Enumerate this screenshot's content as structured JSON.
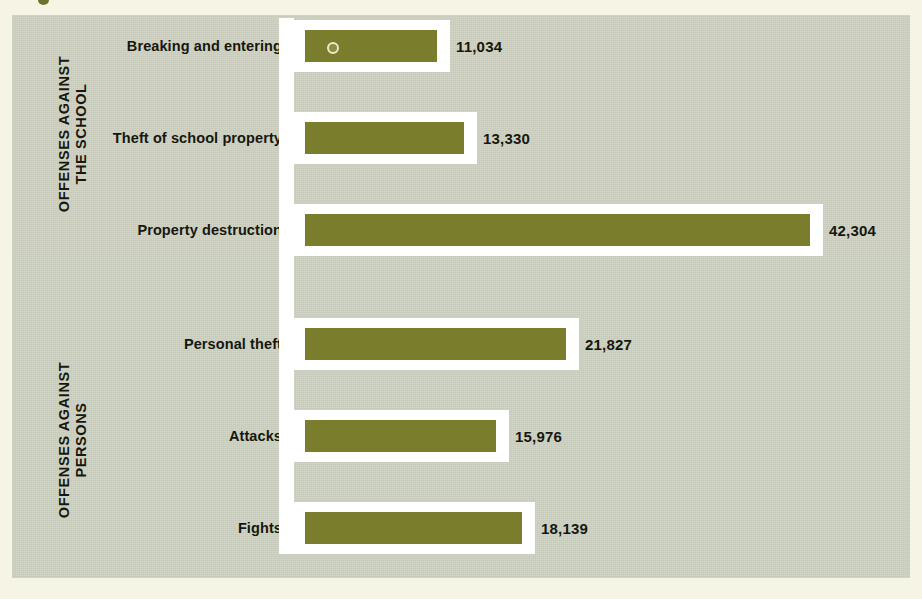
{
  "colors": {
    "page_background": "#f6f4e4",
    "panel_background": "#ccd0bf",
    "bar_fill": "#7a7d2c",
    "bar_outline": "#ffffff",
    "text": "#16170e"
  },
  "groups": [
    {
      "id": "school",
      "label": "OFFENSES AGAINST\nTHE SCHOOL"
    },
    {
      "id": "persons",
      "label": "OFFENSES AGAINST\nPERSONS"
    }
  ],
  "chart_data": {
    "type": "bar",
    "orientation": "horizontal",
    "title": "",
    "subtitle": "",
    "xlabel": "",
    "ylabel": "",
    "grid": false,
    "legend": "none",
    "xlim": [
      0,
      42304
    ],
    "categories": [
      "Breaking and entering",
      "Theft of school property",
      "Property destruction",
      "Personal theft",
      "Attacks",
      "Fights"
    ],
    "values": [
      11034,
      13330,
      42304,
      21827,
      15976,
      18139
    ],
    "value_labels": [
      "11,034",
      "13,330",
      "42,304",
      "21,827",
      "15,976",
      "18,139"
    ],
    "group_of_category": [
      "school",
      "school",
      "school",
      "persons",
      "persons",
      "persons"
    ],
    "series": [
      {
        "name": "Reported offenses",
        "values": [
          11034,
          13330,
          42304,
          21827,
          15976,
          18139
        ]
      }
    ]
  }
}
